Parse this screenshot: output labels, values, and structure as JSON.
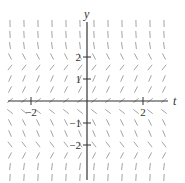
{
  "chart_data": {
    "type": "slope-field",
    "equation": "dy/dt = y(4 - y^2)",
    "xlabel": "t",
    "ylabel": "y",
    "xlim": [
      -3,
      3
    ],
    "ylim": [
      -3.75,
      3.75
    ],
    "x_ticks": [
      {
        "value": -2,
        "label": "−2"
      },
      {
        "value": 2,
        "label": "2"
      }
    ],
    "y_ticks": [
      {
        "value": 2,
        "label": "2"
      },
      {
        "value": 1,
        "label": "1"
      },
      {
        "value": -1,
        "label": "−1"
      },
      {
        "value": -2,
        "label": "−2"
      }
    ],
    "grid_spacing": {
      "t": 0.5,
      "y": 0.5
    },
    "equilibria": [
      -2,
      0,
      2
    ],
    "grid": false,
    "legend": null
  },
  "layout": {
    "origin_px": [
      87,
      101
    ],
    "unit_px": {
      "t": 28,
      "y": 22
    },
    "field_bounds_px": {
      "left": 3,
      "right": 173,
      "top": 20,
      "bottom": 182
    },
    "segment_length_px": 7,
    "colors": {
      "axis": "#333333",
      "segment": "#9a9a9a",
      "text": "#333333"
    }
  },
  "labels": {
    "t_axis": "t",
    "y_axis": "y"
  }
}
